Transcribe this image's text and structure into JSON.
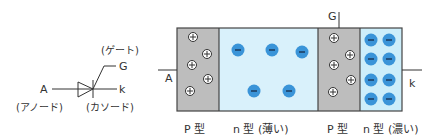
{
  "symbol": {
    "anode_letter": "A",
    "gate_letter": "G",
    "cathode_letter": "k",
    "gate_name": "(ゲート)",
    "anode_name": "(アノード)",
    "cathode_name": "(カソード)"
  },
  "structure": {
    "anode_label": "A",
    "gate_label": "G",
    "cathode_label": "k",
    "regions": [
      {
        "label": "P 型",
        "color": "#bdbdbd",
        "carrier": "hole"
      },
      {
        "label": "n 型 (薄い)",
        "color": "#d9f1fb",
        "carrier": "electron"
      },
      {
        "label": "P 型",
        "color": "#bdbdbd",
        "carrier": "hole"
      },
      {
        "label": "n 型 (濃い)",
        "color": "#cdeefa",
        "carrier": "electron"
      }
    ]
  },
  "colors": {
    "electron": "#3a94d8",
    "p_region": "#bdbdbd",
    "n_region": "#d9f1fb",
    "outline": "#444444"
  }
}
